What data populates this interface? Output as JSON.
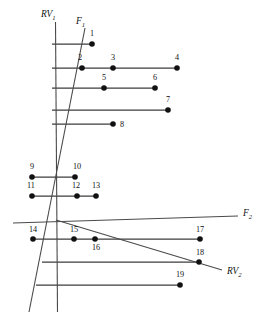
{
  "figure": {
    "background_color": "#ffffff",
    "line_color": "#4a4a4a",
    "dot_color": "#111111",
    "text_color": "#111111",
    "width": 266,
    "height": 318
  },
  "axes": [
    {
      "id": "rv1",
      "label_text": "RV",
      "label_sub": "1",
      "label_x": 41,
      "label_y": 17,
      "x1": 55.5,
      "y1": 22,
      "x2": 57.5,
      "y2": 312,
      "name": "axis-rv1"
    },
    {
      "id": "f1",
      "label_text": "F",
      "label_sub": "1",
      "label_x": 76,
      "label_y": 24,
      "x1": 85,
      "y1": 28,
      "x2": 29,
      "y2": 312,
      "name": "axis-f1"
    },
    {
      "id": "f2",
      "label_text": "F",
      "label_sub": "2",
      "label_x": 243,
      "label_y": 216,
      "x1": 13,
      "y1": 223,
      "x2": 238,
      "y2": 216,
      "name": "axis-f2"
    },
    {
      "id": "rv2",
      "label_text": "RV",
      "label_sub": "2",
      "label_x": 227,
      "label_y": 274,
      "x1": 56,
      "y1": 220,
      "x2": 222,
      "y2": 270,
      "name": "axis-rv2"
    }
  ],
  "chart_data": {
    "type": "diagram",
    "title": "",
    "xlabel": "",
    "ylabel": "",
    "axis_labels": [
      "RV1",
      "F1",
      "F2",
      "RV2"
    ],
    "rows": [
      {
        "row": 1,
        "y": 44,
        "x_start": 52,
        "x_end": 92,
        "points": [
          {
            "id": "1",
            "x": 92,
            "y": 44,
            "label_x": 92,
            "label_y": 36
          }
        ]
      },
      {
        "row": 2,
        "y": 68,
        "x_start": 52,
        "x_end": 177,
        "points": [
          {
            "id": "2",
            "x": 82,
            "y": 68,
            "label_x": 80,
            "label_y": 60
          },
          {
            "id": "3",
            "x": 113,
            "y": 68,
            "label_x": 113,
            "label_y": 60
          },
          {
            "id": "4",
            "x": 177,
            "y": 68,
            "label_x": 177,
            "label_y": 60
          }
        ]
      },
      {
        "row": 3,
        "y": 88,
        "x_start": 52,
        "x_end": 155,
        "points": [
          {
            "id": "5",
            "x": 104,
            "y": 88,
            "label_x": 104,
            "label_y": 80
          },
          {
            "id": "6",
            "x": 155,
            "y": 88,
            "label_x": 155,
            "label_y": 80
          }
        ]
      },
      {
        "row": 4,
        "y": 110,
        "x_start": 52,
        "x_end": 168,
        "points": [
          {
            "id": "7",
            "x": 168,
            "y": 110,
            "label_x": 168,
            "label_y": 102
          }
        ]
      },
      {
        "row": 5,
        "y": 124,
        "x_start": 52,
        "x_end": 113,
        "points": [
          {
            "id": "8",
            "x": 113,
            "y": 124,
            "label_x": 122,
            "label_y": 127
          }
        ]
      },
      {
        "row": 6,
        "y": 177,
        "x_start": 32,
        "x_end": 75,
        "points": [
          {
            "id": "9",
            "x": 32,
            "y": 177,
            "label_x": 32,
            "label_y": 169
          },
          {
            "id": "10",
            "x": 75,
            "y": 177,
            "label_x": 77,
            "label_y": 169
          }
        ]
      },
      {
        "row": 7,
        "y": 196,
        "x_start": 32,
        "x_end": 96,
        "points": [
          {
            "id": "11",
            "x": 32,
            "y": 196,
            "label_x": 31,
            "label_y": 188
          },
          {
            "id": "12",
            "x": 77,
            "y": 196,
            "label_x": 76,
            "label_y": 188
          },
          {
            "id": "13",
            "x": 96,
            "y": 196,
            "label_x": 96,
            "label_y": 188
          }
        ]
      },
      {
        "row": 8,
        "y": 239,
        "x_start": 33,
        "x_end": 200,
        "points": [
          {
            "id": "14",
            "x": 33,
            "y": 239,
            "label_x": 33,
            "label_y": 232
          },
          {
            "id": "15",
            "x": 74,
            "y": 239,
            "label_x": 74,
            "label_y": 232
          },
          {
            "id": "16",
            "x": 95,
            "y": 239,
            "label_x": 96,
            "label_y": 250
          },
          {
            "id": "17",
            "x": 200,
            "y": 239,
            "label_x": 200,
            "label_y": 232
          }
        ]
      },
      {
        "row": 9,
        "y": 262,
        "x_start": 42,
        "x_end": 199,
        "points": [
          {
            "id": "18",
            "x": 199,
            "y": 262,
            "label_x": 200,
            "label_y": 255
          }
        ]
      },
      {
        "row": 10,
        "y": 285,
        "x_start": 36,
        "x_end": 180,
        "points": [
          {
            "id": "19",
            "x": 180,
            "y": 285,
            "label_x": 180,
            "label_y": 277
          }
        ]
      }
    ],
    "dot_radius": 2.8,
    "total_points": 19,
    "grid": false,
    "legend": "none"
  }
}
